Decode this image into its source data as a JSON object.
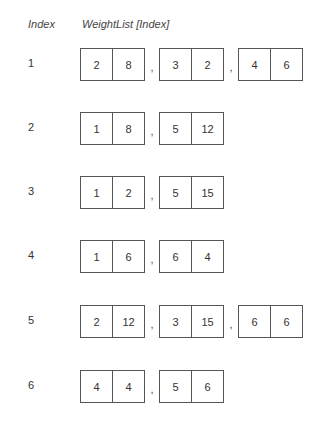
{
  "header": {
    "index_label": "Index",
    "weightlist_label": "WeightList [Index]"
  },
  "separator": ",",
  "rows": [
    {
      "index": "1",
      "pairs": [
        [
          "2",
          "8"
        ],
        [
          "3",
          "2"
        ],
        [
          "4",
          "6"
        ]
      ]
    },
    {
      "index": "2",
      "pairs": [
        [
          "1",
          "8"
        ],
        [
          "5",
          "12"
        ]
      ]
    },
    {
      "index": "3",
      "pairs": [
        [
          "1",
          "2"
        ],
        [
          "5",
          "15"
        ]
      ]
    },
    {
      "index": "4",
      "pairs": [
        [
          "1",
          "6"
        ],
        [
          "6",
          "4"
        ]
      ]
    },
    {
      "index": "5",
      "pairs": [
        [
          "2",
          "12"
        ],
        [
          "3",
          "15"
        ],
        [
          "6",
          "6"
        ]
      ]
    },
    {
      "index": "6",
      "pairs": [
        [
          "4",
          "4"
        ],
        [
          "5",
          "6"
        ]
      ]
    }
  ]
}
